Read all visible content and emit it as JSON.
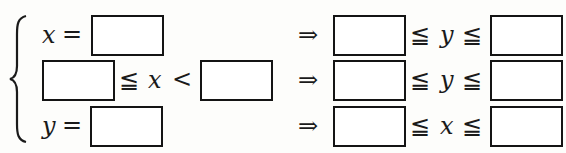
{
  "system": {
    "brace": "{",
    "rows": [
      {
        "left": {
          "var": "x",
          "op": "="
        },
        "implies": "⇒",
        "right": {
          "rel1": "≦",
          "var": "y",
          "rel2": "≦"
        }
      },
      {
        "left": {
          "rel": "≦",
          "var": "x",
          "op": "<"
        },
        "implies": "⇒",
        "right": {
          "rel1": "≦",
          "var": "y",
          "rel2": "≦"
        }
      },
      {
        "left": {
          "var": "y",
          "op": "="
        },
        "implies": "⇒",
        "right": {
          "rel1": "≦",
          "var": "x",
          "rel2": "≦"
        }
      }
    ],
    "blank_boxes": ""
  }
}
